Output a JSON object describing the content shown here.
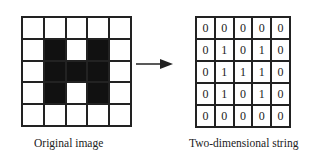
{
  "left_panel": {
    "caption": "Original image",
    "pixels": [
      [
        0,
        0,
        0,
        0,
        0
      ],
      [
        0,
        1,
        0,
        1,
        0
      ],
      [
        0,
        1,
        1,
        1,
        0
      ],
      [
        0,
        1,
        0,
        1,
        0
      ],
      [
        0,
        0,
        0,
        0,
        0
      ]
    ]
  },
  "arrow": {
    "direction": "right"
  },
  "right_panel": {
    "caption": "Two-dimensional string",
    "values": [
      [
        "0",
        "0",
        "0",
        "0",
        "0"
      ],
      [
        "0",
        "1",
        "0",
        "1",
        "0"
      ],
      [
        "0",
        "1",
        "1",
        "1",
        "0"
      ],
      [
        "0",
        "1",
        "0",
        "1",
        "0"
      ],
      [
        "0",
        "0",
        "0",
        "0",
        "0"
      ]
    ]
  }
}
